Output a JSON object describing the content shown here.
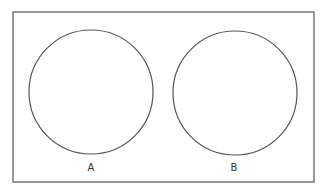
{
  "diagram": {
    "type": "venn-two-disjoint-sets",
    "frame": {
      "x": 13,
      "y": 12,
      "width": 301,
      "height": 170,
      "stroke": "#555555"
    },
    "sets": [
      {
        "label": "A",
        "cx": 91,
        "cy": 92,
        "r": 62,
        "label_x": 91,
        "label_y": 162
      },
      {
        "label": "B",
        "cx": 235,
        "cy": 93,
        "r": 62,
        "label_x": 234,
        "label_y": 162
      }
    ],
    "stroke_color": "#555555"
  }
}
